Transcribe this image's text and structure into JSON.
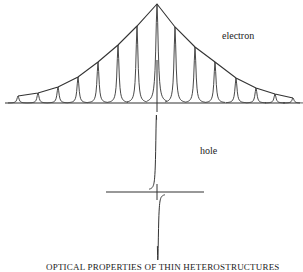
{
  "labels": {
    "electron": "electron",
    "hole": "hole"
  },
  "caption": "OPTICAL PROPERTIES OF THIN HETEROSTRUCTURES",
  "electron_panel": {
    "baseline_y": 103,
    "baseline_x": [
      5,
      300
    ],
    "center_x": 157,
    "peaks": [
      {
        "x": 18,
        "y": 96
      },
      {
        "x": 38,
        "y": 93
      },
      {
        "x": 58,
        "y": 87
      },
      {
        "x": 78,
        "y": 77
      },
      {
        "x": 98,
        "y": 62
      },
      {
        "x": 118,
        "y": 45
      },
      {
        "x": 137,
        "y": 26
      },
      {
        "x": 157,
        "y": 4
      },
      {
        "x": 175,
        "y": 27
      },
      {
        "x": 195,
        "y": 47
      },
      {
        "x": 215,
        "y": 62
      },
      {
        "x": 236,
        "y": 78
      },
      {
        "x": 256,
        "y": 88
      },
      {
        "x": 275,
        "y": 94
      },
      {
        "x": 293,
        "y": 98
      }
    ]
  },
  "hole_panel": {
    "axis_y": 192,
    "axis_x": [
      106,
      204
    ],
    "center_x": 157
  },
  "colors": {
    "line": "#333333",
    "background": "#ffffff"
  }
}
